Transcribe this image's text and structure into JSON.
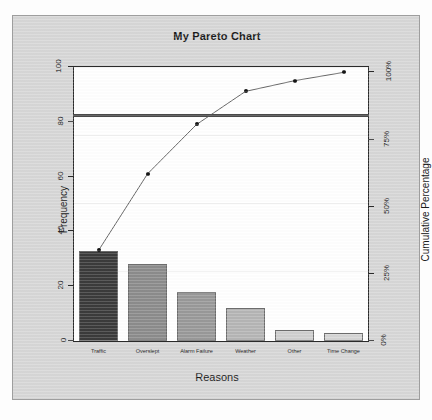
{
  "figure": {
    "title": "My Pareto Chart",
    "background_color": "#d7d7d7",
    "panel_color": "#ffffff",
    "frame_color": "#2b2b2b"
  },
  "chart_data": {
    "type": "bar",
    "title": "My Pareto Chart",
    "xlabel": "Reasons",
    "ylabel": "Frequency",
    "y2label": "Cumulative Percentage",
    "categories": [
      "Traffic",
      "Overslept",
      "Alarm Failure",
      "Weather",
      "Other",
      "Time Change"
    ],
    "values": [
      33,
      28,
      18,
      12,
      4,
      3
    ],
    "cumulative_percent": [
      33.7,
      62.2,
      80.6,
      92.9,
      96.9,
      100.0
    ],
    "ylim": [
      0,
      100
    ],
    "y2lim": [
      0,
      102
    ],
    "yticks": [
      "0",
      "20",
      "40",
      "60",
      "80",
      "100"
    ],
    "ytick_values": [
      0,
      20,
      40,
      60,
      80,
      100
    ],
    "y2ticks": [
      "0%",
      "25%",
      "50%",
      "75%",
      "100%"
    ],
    "y2tick_values": [
      0,
      25,
      50,
      75,
      100
    ],
    "grid": true,
    "legend": "none",
    "reference_line": {
      "label": "80% cutoff",
      "frequency_value": 83,
      "percent_value": 80,
      "color": "#4a4a4a"
    },
    "bar_colors": [
      "#3b3b3b",
      "#8c8c8c",
      "#999999",
      "#b5b5b5",
      "#cfcfcf",
      "#d5d5d5"
    ],
    "line_color": "#555555",
    "marker_color": "#141414",
    "series": [
      {
        "name": "Frequency",
        "type": "bar",
        "values": [
          33,
          28,
          18,
          12,
          4,
          3
        ]
      },
      {
        "name": "Cumulative Percentage",
        "type": "line",
        "values": [
          33.7,
          62.2,
          80.6,
          92.9,
          96.9,
          100.0
        ]
      }
    ]
  }
}
